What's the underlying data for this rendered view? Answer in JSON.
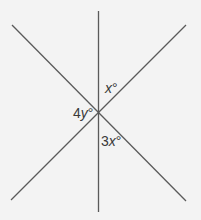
{
  "diagram": {
    "type": "intersecting-lines",
    "intersection": {
      "x": 98,
      "y": 111
    },
    "lines": [
      {
        "name": "vertical-line",
        "x1": 98.5,
        "y1": 11,
        "x2": 98.5,
        "y2": 212
      },
      {
        "name": "diagonal-line-descending",
        "x1": 12,
        "y1": 25,
        "x2": 186,
        "y2": 201
      },
      {
        "name": "diagonal-line-ascending",
        "x1": 11,
        "y1": 200,
        "x2": 186,
        "y2": 25
      }
    ],
    "line_color": "#5a5a5a",
    "background_color": "#f3f3f3",
    "angle_labels": [
      {
        "id": "angle-x",
        "coef": "",
        "var": "x",
        "unit": "°"
      },
      {
        "id": "angle-4y",
        "coef": "4",
        "var": "y",
        "unit": "°"
      },
      {
        "id": "angle-3x",
        "coef": "3",
        "var": "x",
        "unit": "°"
      }
    ]
  }
}
